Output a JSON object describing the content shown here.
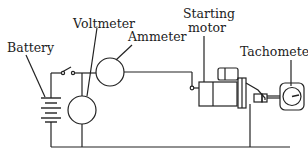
{
  "labels": {
    "battery": "Battery",
    "voltmeter": "Voltmeter",
    "ammeter": "Ammeter",
    "starting_motor_line1": "Starting",
    "starting_motor_line2": "motor",
    "tachometer": "Tachometer"
  },
  "colors": {
    "line": "#222222",
    "background": "#ffffff"
  }
}
